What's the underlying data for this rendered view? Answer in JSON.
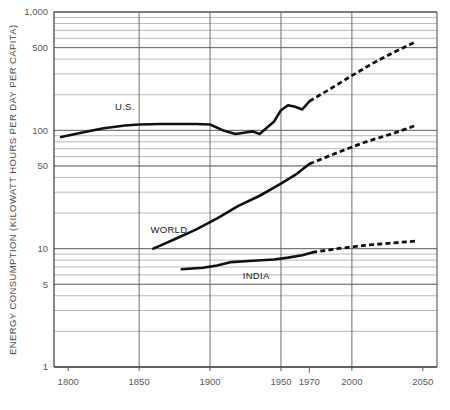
{
  "chart_data": {
    "type": "line",
    "title": "",
    "xlabel": "",
    "ylabel": "ENERGY CONSUMPTION (KILOWATT HOURS PER DAY PER CAPITA)",
    "yscale": "log",
    "ylim": [
      1,
      1000
    ],
    "xlim": [
      1790,
      2060
    ],
    "grid": true,
    "legend_position": "inline-labels",
    "y_tick_labels": [
      "1,000",
      "500",
      "100",
      "50",
      "10",
      "5",
      "1"
    ],
    "y_tick_values": [
      1000,
      500,
      100,
      50,
      10,
      5,
      1
    ],
    "x_tick_labels": [
      "1800",
      "1850",
      "1900",
      "1950",
      "1970",
      "2000",
      "2050"
    ],
    "x_tick_values": [
      1800,
      1850,
      1900,
      1950,
      1970,
      2000,
      2050
    ],
    "series": [
      {
        "name": "U.S.",
        "label": "U.S.",
        "style": "solid-then-dashed",
        "solid": {
          "x": [
            1795,
            1810,
            1825,
            1840,
            1850,
            1865,
            1880,
            1890,
            1900,
            1910,
            1918,
            1925,
            1930,
            1935,
            1940,
            1945,
            1950,
            1955,
            1960,
            1965,
            1970
          ],
          "y": [
            88,
            96,
            104,
            110,
            112,
            113,
            113,
            113,
            112,
            99,
            93,
            96,
            98,
            93,
            105,
            118,
            148,
            163,
            158,
            150,
            176
          ]
        },
        "dashed": {
          "x": [
            1970,
            1985,
            2000,
            2015,
            2030,
            2045
          ],
          "y": [
            176,
            225,
            290,
            370,
            460,
            560
          ]
        }
      },
      {
        "name": "WORLD",
        "label": "WORLD",
        "style": "solid-then-dashed",
        "solid": {
          "x": [
            1860,
            1875,
            1890,
            1905,
            1920,
            1935,
            1950,
            1960,
            1970
          ],
          "y": [
            10.0,
            12.0,
            14.5,
            18.0,
            23.0,
            28.0,
            35.5,
            42.0,
            52.0
          ]
        },
        "dashed": {
          "x": [
            1970,
            1990,
            2010,
            2030,
            2045
          ],
          "y": [
            52,
            65,
            80,
            95,
            110
          ]
        }
      },
      {
        "name": "INDIA",
        "label": "INDIA",
        "style": "solid-then-dashed",
        "solid": {
          "x": [
            1880,
            1895,
            1905,
            1915,
            1930,
            1945,
            1955,
            1965,
            1972
          ],
          "y": [
            6.7,
            6.9,
            7.2,
            7.7,
            7.9,
            8.1,
            8.4,
            8.8,
            9.3
          ]
        },
        "dashed": {
          "x": [
            1972,
            1990,
            2010,
            2030,
            2045
          ],
          "y": [
            9.3,
            10.0,
            10.7,
            11.2,
            11.6
          ]
        }
      }
    ],
    "annotations": [
      {
        "text": "U.S.",
        "x": 1833,
        "y": 150
      },
      {
        "text": "WORLD",
        "x": 1858,
        "y": 13.5
      },
      {
        "text": "INDIA",
        "x": 1923,
        "y": 5.6
      }
    ],
    "colors": {
      "line": "#111111",
      "grid_major": "#5d5d5d",
      "grid_minor": "#9a9a9a",
      "axis": "#4a4a4a",
      "text": "#555555",
      "background": "#ffffff"
    }
  }
}
